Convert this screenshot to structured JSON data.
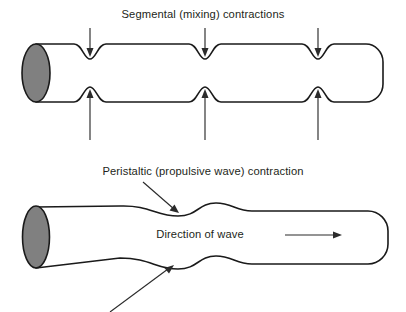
{
  "figure": {
    "width": 406,
    "height": 312,
    "background_color": "#ffffff",
    "outline_color": "#1a1a1a",
    "end_cap_fill": "#808080",
    "text_color": "#231f20"
  },
  "panels": [
    {
      "id": "segmental",
      "caption": "Segmental (mixing) contractions",
      "caption_position": {
        "x": 203,
        "y": 18
      },
      "tube": {
        "left_x": 22,
        "right_x": 383,
        "top_y": 44,
        "bottom_y": 102,
        "constriction_count": 3,
        "constriction_x": [
          90,
          205,
          318
        ],
        "constriction_depth": 15
      },
      "arrows": [
        {
          "name": "top-arrow-1",
          "direction": "down",
          "x": 90,
          "from_y": 28,
          "to_y": 56
        },
        {
          "name": "top-arrow-2",
          "direction": "down",
          "x": 205,
          "from_y": 28,
          "to_y": 56
        },
        {
          "name": "top-arrow-3",
          "direction": "down",
          "x": 318,
          "from_y": 28,
          "to_y": 56
        },
        {
          "name": "bottom-arrow-1",
          "direction": "up",
          "x": 90,
          "from_y": 140,
          "to_y": 92
        },
        {
          "name": "bottom-arrow-2",
          "direction": "up",
          "x": 205,
          "from_y": 140,
          "to_y": 92
        },
        {
          "name": "bottom-arrow-3",
          "direction": "up",
          "x": 318,
          "from_y": 140,
          "to_y": 92
        }
      ]
    },
    {
      "id": "peristaltic",
      "caption": "Peristaltic (propulsive wave) contraction",
      "caption_position": {
        "x": 203,
        "y": 175
      },
      "direction_label": "Direction of wave",
      "direction_label_position": {
        "x": 200,
        "y": 238
      },
      "tube": {
        "left_x": 22,
        "right_x": 388,
        "top_y": 207,
        "bottom_y": 268,
        "pinch_x": 178,
        "bulge_x": 210
      },
      "leaders": [
        {
          "name": "peristaltic-leader-upper",
          "from_x": 143,
          "from_y": 182,
          "to_x": 178,
          "to_y": 212
        },
        {
          "name": "peristaltic-leader-lower",
          "from_x": 110,
          "from_y": 310,
          "to_x": 172,
          "to_y": 266
        }
      ],
      "direction_arrow": {
        "from_x": 297,
        "to_x": 341,
        "y": 235
      }
    }
  ]
}
